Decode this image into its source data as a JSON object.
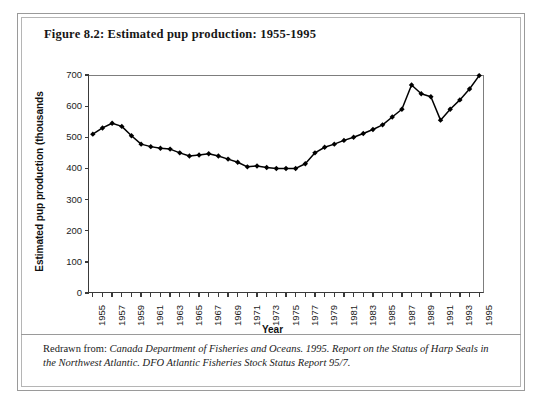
{
  "figure": {
    "title": "Figure 8.2: Estimated pup production: 1955-1995",
    "caption_prefix": "Redrawn from: ",
    "caption_italic_1": "Canada Department of Fisheries and Oceans. 1995.  Report on the Status of Harp Seals in the Northwest Atlantic.  DFO Atlantic Fisheries Stock Status Report 95/7.",
    "caption_full": "Redrawn from: Canada Department of Fisheries and Oceans. 1995.  Report on the Status of Harp Seals in the Northwest Atlantic.  DFO Atlantic Fisheries Stock Status Report 95/7."
  },
  "chart_data": {
    "type": "line",
    "title": "Figure 8.2: Estimated pup production: 1955-1995",
    "xlabel": "Year",
    "ylabel": "Estimated pup production (thousands",
    "xlim": [
      1954.5,
      1995.5
    ],
    "ylim": [
      0,
      700
    ],
    "yticks": [
      0,
      100,
      200,
      300,
      400,
      500,
      600,
      700
    ],
    "ytick_labels": [
      "0",
      "100",
      "200",
      "300",
      "400",
      "500",
      "600",
      "700"
    ],
    "xtick_labels": [
      "1955",
      "1957",
      "1959",
      "1961",
      "1963",
      "1965",
      "1967",
      "1969",
      "1971",
      "1973",
      "1975",
      "1977",
      "1979",
      "1981",
      "1983",
      "1985",
      "1987",
      "1989",
      "1991",
      "1993",
      "1995"
    ],
    "grid": false,
    "legend": false,
    "marker": "filled-diamond",
    "line_color": "#000000",
    "series": [
      {
        "name": "Estimated pup production",
        "x": [
          1955,
          1956,
          1957,
          1958,
          1959,
          1960,
          1961,
          1962,
          1963,
          1964,
          1965,
          1966,
          1967,
          1968,
          1969,
          1970,
          1971,
          1972,
          1973,
          1974,
          1975,
          1976,
          1977,
          1978,
          1979,
          1980,
          1981,
          1982,
          1983,
          1984,
          1985,
          1986,
          1987,
          1988,
          1989,
          1990,
          1991,
          1992,
          1993,
          1994,
          1995
        ],
        "values": [
          510,
          530,
          545,
          535,
          505,
          478,
          470,
          465,
          462,
          450,
          440,
          443,
          447,
          440,
          430,
          420,
          405,
          408,
          403,
          400,
          400,
          400,
          415,
          450,
          468,
          478,
          490,
          500,
          512,
          525,
          540,
          565,
          590,
          668,
          640,
          630,
          555,
          590,
          620,
          655,
          698
        ]
      }
    ]
  }
}
